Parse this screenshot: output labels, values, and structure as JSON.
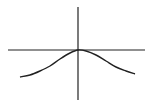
{
  "figure": {
    "axes": {
      "x_axis": {
        "x1": 8,
        "x2": 145,
        "y": 50
      },
      "y_axis": {
        "x": 78,
        "y1": 7,
        "y2": 100
      },
      "color": "#222222"
    },
    "curve": {
      "color": "#222222",
      "shape": "inverted-bell",
      "points": [
        [
          20,
          77
        ],
        [
          30,
          75
        ],
        [
          40,
          71
        ],
        [
          50,
          66
        ],
        [
          60,
          59
        ],
        [
          70,
          53
        ],
        [
          78,
          50
        ],
        [
          86,
          51
        ],
        [
          96,
          55
        ],
        [
          106,
          61
        ],
        [
          116,
          67
        ],
        [
          126,
          71
        ],
        [
          135,
          74
        ]
      ]
    }
  }
}
